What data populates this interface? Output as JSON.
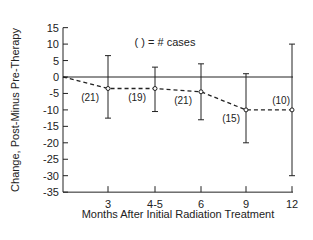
{
  "chart_data": {
    "type": "line",
    "title": "",
    "legend_note": "( ) = # cases",
    "xlabel": "Months After Initial Radiation Treatment",
    "ylabel": "Change, Post-Minus Pre-Therapy",
    "ylim": [
      -35,
      15
    ],
    "yticks": [
      15,
      10,
      5,
      0,
      -5,
      -10,
      -15,
      -20,
      -25,
      -30,
      -35
    ],
    "categories": [
      "0",
      "3",
      "4-5",
      "6",
      "9",
      "12"
    ],
    "xtick_labels": [
      "3",
      "4-5",
      "6",
      "9",
      "12"
    ],
    "grid": false,
    "reference_line": 0,
    "series": [
      {
        "name": "Mean change",
        "style": "dashed",
        "x": [
          "0",
          "3",
          "4-5",
          "6",
          "9",
          "12"
        ],
        "values": [
          0,
          -3.5,
          -3.5,
          -4.5,
          -10,
          -10
        ],
        "error_upper": [
          null,
          6.5,
          3,
          4,
          1,
          10
        ],
        "error_lower": [
          null,
          -12.5,
          -10.5,
          -13,
          -20,
          -30
        ],
        "n_cases": [
          null,
          "(21)",
          "(19)",
          "(21)",
          "(15)",
          "(10)"
        ]
      }
    ]
  }
}
